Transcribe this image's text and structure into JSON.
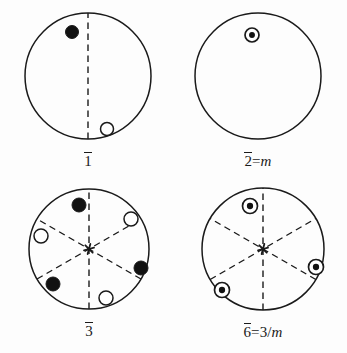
{
  "figure": {
    "background_color": "#fdfdfd",
    "line_color": "#1a1a1a",
    "fill_filled": "#111111",
    "fill_open": "#ffffff"
  },
  "panels": [
    {
      "id": "panel-1bar",
      "name": "one-bar",
      "label_number": "1",
      "label_overline": true,
      "label_suffix": "",
      "label_suffix_italic": "",
      "label_full": "1̄",
      "circle": {
        "cx": 88,
        "cy": 76,
        "r": 63
      },
      "dashed_lines": [
        {
          "angle_deg": 90,
          "name": "vertical-dashed-line"
        }
      ],
      "center_marker": "none",
      "points": [
        {
          "name": "filled-dot",
          "type": "filled",
          "x": 72,
          "y": 32,
          "r": 6.5
        },
        {
          "name": "open-circle",
          "type": "open",
          "x": 107,
          "y": 129,
          "r": 6.5
        }
      ]
    },
    {
      "id": "panel-2bar",
      "name": "two-bar-equals-m",
      "label_number": "2",
      "label_overline": true,
      "label_suffix": "=",
      "label_suffix_italic": "m",
      "label_full": "2̄=m",
      "circle": {
        "cx": 258,
        "cy": 76,
        "r": 63
      },
      "dashed_lines": [],
      "center_marker": "none",
      "points": [
        {
          "name": "dot-in-circle",
          "type": "superposed",
          "x": 252,
          "y": 35,
          "r": 7
        }
      ]
    },
    {
      "id": "panel-3bar",
      "name": "three-bar",
      "label_number": "3",
      "label_overline": true,
      "label_suffix": "",
      "label_suffix_italic": "",
      "label_full": "3̄",
      "circle": {
        "cx": 89,
        "cy": 249,
        "r": 60
      },
      "dashed_lines": [
        {
          "angle_deg": 90,
          "name": "vertical-dashed-line"
        },
        {
          "angle_deg": 30,
          "name": "dashed-line-30deg"
        },
        {
          "angle_deg": 150,
          "name": "dashed-line-150deg"
        }
      ],
      "center_marker": "three-fold-inversion-star",
      "points": [
        {
          "name": "filled-dot",
          "type": "filled",
          "x": 79,
          "y": 205,
          "r": 7
        },
        {
          "name": "open-circle",
          "type": "open",
          "x": 131,
          "y": 219,
          "r": 7
        },
        {
          "name": "filled-dot",
          "type": "filled",
          "x": 141,
          "y": 268,
          "r": 7
        },
        {
          "name": "open-circle",
          "type": "open",
          "x": 106,
          "y": 298,
          "r": 7
        },
        {
          "name": "filled-dot",
          "type": "filled",
          "x": 53,
          "y": 284,
          "r": 7
        },
        {
          "name": "open-circle",
          "type": "open",
          "x": 41,
          "y": 236,
          "r": 7
        }
      ]
    },
    {
      "id": "panel-6bar",
      "name": "six-bar-equals-three-over-m",
      "label_number": "6",
      "label_overline": true,
      "label_suffix": "=3/",
      "label_suffix_italic": "m",
      "label_full": "6̄=3/m",
      "circle": {
        "cx": 263,
        "cy": 249,
        "r": 61
      },
      "dashed_lines": [
        {
          "angle_deg": 90,
          "name": "vertical-dashed-line"
        },
        {
          "angle_deg": 30,
          "name": "dashed-line-30deg"
        },
        {
          "angle_deg": 150,
          "name": "dashed-line-150deg"
        }
      ],
      "center_marker": "three-fold-inversion-star",
      "points": [
        {
          "name": "dot-in-circle",
          "type": "superposed",
          "x": 250,
          "y": 206,
          "r": 7.5
        },
        {
          "name": "dot-in-circle",
          "type": "superposed",
          "x": 316,
          "y": 267,
          "r": 7.5
        },
        {
          "name": "dot-in-circle",
          "type": "superposed",
          "x": 222,
          "y": 290,
          "r": 7.5
        }
      ]
    }
  ]
}
